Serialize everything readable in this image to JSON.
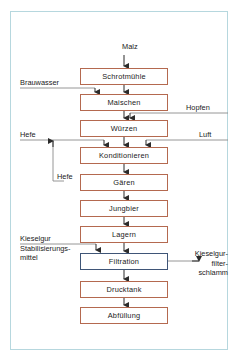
{
  "diagram": {
    "frame_color": "#b6d7de",
    "box_border_color": "#b4694f",
    "highlight_border_color": "#3f5577",
    "line_color": "#8a8a8a",
    "input_label": "Malz",
    "nodes": [
      {
        "id": "schrotmuehle",
        "label": "Schrotmühle",
        "highlight": false,
        "top": 68
      },
      {
        "id": "maischen",
        "label": "Maischen",
        "highlight": false,
        "top": 94
      },
      {
        "id": "wuerzen",
        "label": "Würzen",
        "highlight": false,
        "top": 120
      },
      {
        "id": "konditionieren",
        "label": "Konditionieren",
        "highlight": false,
        "top": 147
      },
      {
        "id": "gaeren",
        "label": "Gären",
        "highlight": false,
        "top": 174
      },
      {
        "id": "jungbier",
        "label": "Jungbier",
        "highlight": false,
        "top": 200
      },
      {
        "id": "lagern",
        "label": "Lagern",
        "highlight": false,
        "top": 226
      },
      {
        "id": "filtration",
        "label": "Filtration",
        "highlight": true,
        "top": 253
      },
      {
        "id": "drucktank",
        "label": "Drucktank",
        "highlight": false,
        "top": 281
      },
      {
        "id": "abfuellung",
        "label": "Abfüllung",
        "highlight": false,
        "top": 307
      }
    ],
    "side_labels": [
      {
        "id": "brauwasser",
        "text": "Brauwasser",
        "side": "left"
      },
      {
        "id": "hopfen",
        "text": "Hopfen",
        "side": "right"
      },
      {
        "id": "hefe-left",
        "text": "Hefe",
        "side": "left"
      },
      {
        "id": "luft",
        "text": "Luft",
        "side": "right"
      },
      {
        "id": "hefe-recycle",
        "text": "Hefe",
        "side": "left"
      },
      {
        "id": "kieselgur-stabilisierungsmittel",
        "text": "Kieselgur\nStabilisierungs-\nmittel",
        "side": "left"
      },
      {
        "id": "kieselgurfilterschlamm",
        "text": "Kieselgur-\nfilter-\nschlamm",
        "side": "right"
      }
    ]
  }
}
